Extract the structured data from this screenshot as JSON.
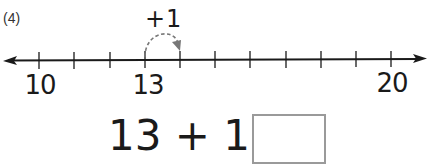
{
  "problem": {
    "number_label": "(4)",
    "jump_label": "+1",
    "equation": {
      "left_operand": "13",
      "operator": " + ",
      "right_operand": "1",
      "equals": " = ",
      "answer": ""
    }
  },
  "number_line": {
    "start": 10,
    "end": 20,
    "step": 1,
    "tick_x": [
      39,
      74,
      110,
      145,
      180,
      215,
      250,
      286,
      321,
      356,
      391
    ],
    "labels": [
      {
        "value": "10",
        "x": 40
      },
      {
        "value": "13",
        "x": 148
      },
      {
        "value": "20",
        "x": 392
      }
    ],
    "jump": {
      "from": 13,
      "to": 14
    },
    "colors": {
      "line": "#1a1a1a",
      "jump_arc": "#777777",
      "answer_box_border": "#9a9a9a"
    }
  }
}
